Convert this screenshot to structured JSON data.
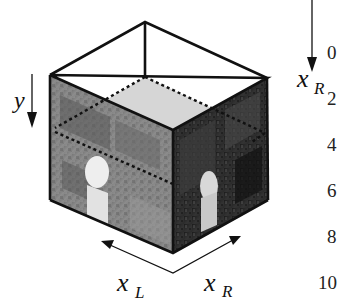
{
  "figure": {
    "type": "disparity-space-image-cube",
    "axis_labels": {
      "y": "y",
      "x_left": "x",
      "x_left_sub": "L",
      "x_right": "x",
      "x_right_sub": "R",
      "side_axis": "x",
      "side_axis_sub": "R"
    },
    "side_ticks": [
      "0",
      "2",
      "4",
      "6",
      "8",
      "10"
    ],
    "faces": {
      "left_face": "left stereo image (bright, with mannequin head)",
      "right_face": "right stereo image (dark, with mannequin head)",
      "slice_plane": "horizontal dashed slice plane"
    },
    "colors": {
      "edge": "#111111",
      "slice_fill": "#d6d6d6",
      "left_face_base": "#8a8a8a",
      "right_face_base": "#2a2a2a",
      "background": "#ffffff"
    }
  }
}
